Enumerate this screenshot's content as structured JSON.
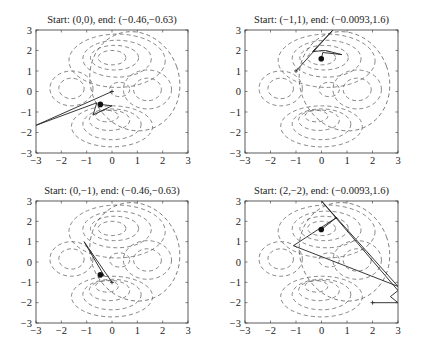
{
  "figure": {
    "panels": [
      {
        "title": "Start: (0,0), end: (−0.46,−0.63)"
      },
      {
        "title": "Start: (−1,1), end: (−0.0093,1.6)"
      },
      {
        "title": "Start: (0,−1), end: (−0.46,−0.63)"
      },
      {
        "title": "Start: (2,−2), end: (−0.0093,1.6)"
      }
    ]
  },
  "chart_data": [
    {
      "type": "line",
      "title": "Start: (0,0), end: (−0.46,−0.63)",
      "xlabel": "",
      "ylabel": "",
      "xlim": [
        -3,
        3
      ],
      "ylim": [
        -3,
        3
      ],
      "xticks": [
        "−3",
        "−2",
        "−1",
        "0",
        "1",
        "2",
        "3"
      ],
      "yticks": [
        "−3",
        "−2",
        "−1",
        "0",
        "1",
        "2",
        "3"
      ],
      "grid": false,
      "background": "dashed contour lines of an objective function",
      "start": [
        0,
        0
      ],
      "end": [
        -0.46,
        -0.63
      ],
      "path": [
        [
          0,
          0
        ],
        [
          -3,
          -1.65
        ],
        [
          -0.6,
          -0.55
        ],
        [
          -0.75,
          -1.15
        ],
        [
          0,
          -0.7
        ],
        [
          -0.46,
          -0.63
        ]
      ]
    },
    {
      "type": "line",
      "title": "Start: (−1,1), end: (−0.0093,1.6)",
      "xlabel": "",
      "ylabel": "",
      "xlim": [
        -3,
        3
      ],
      "ylim": [
        -3,
        3
      ],
      "xticks": [
        "−3",
        "−2",
        "−1",
        "0",
        "1",
        "2",
        "3"
      ],
      "yticks": [
        "−3",
        "−2",
        "−1",
        "0",
        "1",
        "2",
        "3"
      ],
      "grid": false,
      "start": [
        -1,
        1
      ],
      "end": [
        -0.0093,
        1.6
      ],
      "path": [
        [
          -1,
          1
        ],
        [
          0.45,
          3
        ],
        [
          -0.35,
          1.95
        ],
        [
          0.15,
          2
        ],
        [
          0.8,
          1.8
        ],
        [
          0.05,
          1.9
        ],
        [
          -0.0093,
          1.6
        ]
      ]
    },
    {
      "type": "line",
      "title": "Start: (0,−1), end: (−0.46,−0.63)",
      "xlabel": "",
      "ylabel": "",
      "xlim": [
        -3,
        3
      ],
      "ylim": [
        -3,
        3
      ],
      "xticks": [
        "−3",
        "−2",
        "−1",
        "0",
        "1",
        "2",
        "3"
      ],
      "yticks": [
        "−3",
        "−2",
        "−1",
        "0",
        "1",
        "2",
        "3"
      ],
      "grid": false,
      "start": [
        0,
        -1
      ],
      "end": [
        -0.46,
        -0.63
      ],
      "path": [
        [
          0,
          -1
        ],
        [
          -1.1,
          1
        ],
        [
          -0.3,
          -0.7
        ],
        [
          -0.46,
          -0.63
        ]
      ]
    },
    {
      "type": "line",
      "title": "Start: (2,−2), end: (−0.0093,1.6)",
      "xlabel": "",
      "ylabel": "",
      "xlim": [
        -3,
        3
      ],
      "ylim": [
        -3,
        3
      ],
      "xticks": [
        "−3",
        "−2",
        "−1",
        "0",
        "1",
        "2",
        "3"
      ],
      "yticks": [
        "−3",
        "−2",
        "−1",
        "0",
        "1",
        "2",
        "3"
      ],
      "grid": false,
      "start": [
        2,
        -2
      ],
      "end": [
        -0.0093,
        1.6
      ],
      "path": [
        [
          2,
          -2
        ],
        [
          3,
          -2
        ],
        [
          2.7,
          -1.7
        ],
        [
          3,
          -1.4
        ],
        [
          0,
          3
        ],
        [
          3,
          -1.2
        ],
        [
          -1.1,
          0.8
        ],
        [
          0.6,
          2.2
        ],
        [
          -0.0093,
          1.6
        ]
      ]
    }
  ]
}
